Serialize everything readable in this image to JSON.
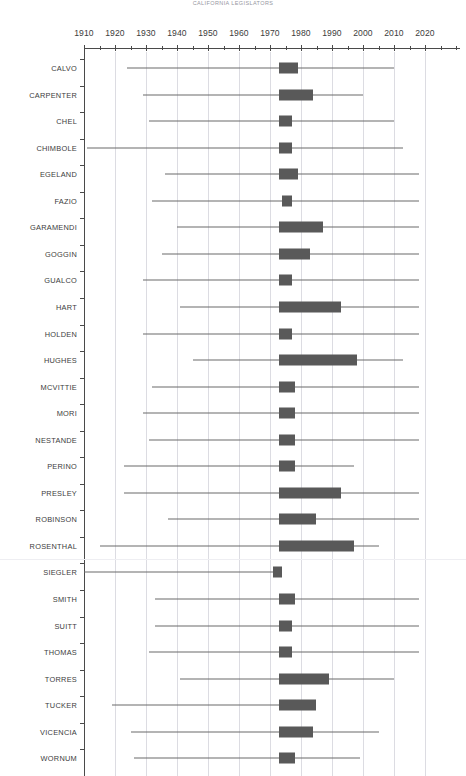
{
  "chart_data": {
    "type": "bar",
    "subtype": "box-whisker-horizontal",
    "title": "CALIFORNIA LEGISLATORS",
    "xlabel": "",
    "ylabel": "",
    "xlim": [
      1906,
      2024
    ],
    "xticks": [
      1910,
      1920,
      1930,
      1940,
      1950,
      1960,
      1970,
      1980,
      1990,
      2000,
      2010,
      2020
    ],
    "xtick_labels": [
      "1910",
      "1920",
      "1930",
      "1940",
      "1950",
      "1960",
      "1970",
      "1980",
      "1990",
      "2000",
      "2010",
      "2020"
    ],
    "minor_tick_step": 5,
    "grid": "vertical-decades",
    "legend": "none",
    "bar_color": "#595959",
    "whisker_color": "#6a6a6a",
    "axis_color": "#4a4a4a",
    "grid_color": "#dcdce2",
    "categories": [
      "CALVO",
      "CARPENTER",
      "CHEL",
      "CHIMBOLE",
      "EGELAND",
      "FAZIO",
      "GARAMENDI",
      "GOGGIN",
      "GUALCO",
      "HART",
      "HOLDEN",
      "HUGHES",
      "MCVITTIE",
      "MORI",
      "NESTANDE",
      "PERINO",
      "PRESLEY",
      "ROBINSON",
      "ROSENTHAL",
      "SIEGLER",
      "SMITH",
      "SUITT",
      "THOMAS",
      "TORRES",
      "TUCKER",
      "VICENCIA",
      "WORNUM"
    ],
    "series": [
      {
        "category": "CALVO",
        "whisker_min": 1924,
        "box_start": 1973,
        "box_end": 1979,
        "whisker_max": 2010
      },
      {
        "category": "CARPENTER",
        "whisker_min": 1929,
        "box_start": 1973,
        "box_end": 1984,
        "whisker_max": 2000
      },
      {
        "category": "CHEL",
        "whisker_min": 1931,
        "box_start": 1973,
        "box_end": 1977,
        "whisker_max": 2010
      },
      {
        "category": "CHIMBOLE",
        "whisker_min": 1911,
        "box_start": 1973,
        "box_end": 1977,
        "whisker_max": 2013
      },
      {
        "category": "EGELAND",
        "whisker_min": 1936,
        "box_start": 1973,
        "box_end": 1979,
        "whisker_max": 2018
      },
      {
        "category": "FAZIO",
        "whisker_min": 1932,
        "box_start": 1974,
        "box_end": 1977,
        "whisker_max": 2018
      },
      {
        "category": "GARAMENDI",
        "whisker_min": 1940,
        "box_start": 1973,
        "box_end": 1987,
        "whisker_max": 2018
      },
      {
        "category": "GOGGIN",
        "whisker_min": 1935,
        "box_start": 1973,
        "box_end": 1983,
        "whisker_max": 2018
      },
      {
        "category": "GUALCO",
        "whisker_min": 1929,
        "box_start": 1973,
        "box_end": 1977,
        "whisker_max": 2018
      },
      {
        "category": "HART",
        "whisker_min": 1941,
        "box_start": 1973,
        "box_end": 1993,
        "whisker_max": 2018
      },
      {
        "category": "HOLDEN",
        "whisker_min": 1929,
        "box_start": 1973,
        "box_end": 1977,
        "whisker_max": 2018
      },
      {
        "category": "HUGHES",
        "whisker_min": 1945,
        "box_start": 1973,
        "box_end": 1998,
        "whisker_max": 2013
      },
      {
        "category": "MCVITTIE",
        "whisker_min": 1932,
        "box_start": 1973,
        "box_end": 1978,
        "whisker_max": 2018
      },
      {
        "category": "MORI",
        "whisker_min": 1929,
        "box_start": 1973,
        "box_end": 1978,
        "whisker_max": 2018
      },
      {
        "category": "NESTANDE",
        "whisker_min": 1931,
        "box_start": 1973,
        "box_end": 1978,
        "whisker_max": 2018
      },
      {
        "category": "PERINO",
        "whisker_min": 1923,
        "box_start": 1973,
        "box_end": 1978,
        "whisker_max": 1997
      },
      {
        "category": "PRESLEY",
        "whisker_min": 1923,
        "box_start": 1973,
        "box_end": 1993,
        "whisker_max": 2018
      },
      {
        "category": "ROBINSON",
        "whisker_min": 1937,
        "box_start": 1973,
        "box_end": 1985,
        "whisker_max": 2018
      },
      {
        "category": "ROSENTHAL",
        "whisker_min": 1915,
        "box_start": 1973,
        "box_end": 1997,
        "whisker_max": 2005
      },
      {
        "category": "SIEGLER",
        "whisker_min": 1906,
        "box_start": 1971,
        "box_end": 1974,
        "whisker_max": 1974
      },
      {
        "category": "SMITH",
        "whisker_min": 1933,
        "box_start": 1973,
        "box_end": 1978,
        "whisker_max": 2018
      },
      {
        "category": "SUITT",
        "whisker_min": 1933,
        "box_start": 1973,
        "box_end": 1977,
        "whisker_max": 2018
      },
      {
        "category": "THOMAS",
        "whisker_min": 1931,
        "box_start": 1973,
        "box_end": 1977,
        "whisker_max": 2018
      },
      {
        "category": "TORRES",
        "whisker_min": 1941,
        "box_start": 1973,
        "box_end": 1989,
        "whisker_max": 2010
      },
      {
        "category": "TUCKER",
        "whisker_min": 1919,
        "box_start": 1973,
        "box_end": 1985,
        "whisker_max": 1985
      },
      {
        "category": "VICENCIA",
        "whisker_min": 1925,
        "box_start": 1973,
        "box_end": 1984,
        "whisker_max": 2005
      },
      {
        "category": "WORNUM",
        "whisker_min": 1926,
        "box_start": 1973,
        "box_end": 1978,
        "whisker_max": 1999
      }
    ]
  }
}
